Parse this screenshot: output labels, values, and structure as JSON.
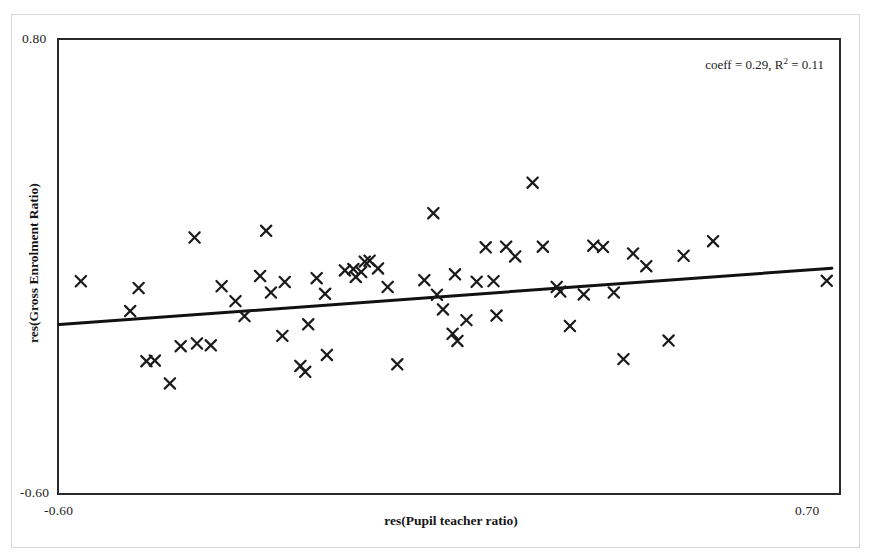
{
  "chart_data": {
    "type": "scatter",
    "title": "",
    "xlabel": "res(Pupil teacher ratio)",
    "ylabel": "res(Gross Enrolment Ratio)",
    "xlim": [
      -0.6,
      0.7
    ],
    "ylim": [
      -0.6,
      0.8
    ],
    "xticks": [
      "-0.60",
      "0.70"
    ],
    "yticks": [
      "-0.60",
      "0.80"
    ],
    "grid": false,
    "legend": null,
    "marker": "x",
    "marker_color": "#1a1a1a",
    "annotations": [
      {
        "text_prefix": "coeff  = 0.29, R",
        "superscript": "2",
        "text_suffix": " = 0.11",
        "coeff": 0.29,
        "r_squared": 0.11,
        "position": "top-right"
      }
    ],
    "fit_line": {
      "type": "linear",
      "color": "#111111",
      "slope": 0.135,
      "x_start": -0.5975,
      "y_start": -0.0787,
      "x_end": 0.6865,
      "y_end": 0.0947
    },
    "points": [
      {
        "x": -0.562,
        "y": 0.0547
      },
      {
        "x": -0.48,
        "y": -0.0372
      },
      {
        "x": -0.466,
        "y": 0.0338
      },
      {
        "x": -0.453,
        "y": -0.1913
      },
      {
        "x": -0.439,
        "y": -0.1895
      },
      {
        "x": -0.414,
        "y": -0.2597
      },
      {
        "x": -0.396,
        "y": -0.1452
      },
      {
        "x": -0.373,
        "y": 0.1893
      },
      {
        "x": -0.369,
        "y": -0.1369
      },
      {
        "x": -0.346,
        "y": -0.1426
      },
      {
        "x": -0.328,
        "y": 0.0393
      },
      {
        "x": -0.305,
        "y": -0.0066
      },
      {
        "x": -0.29,
        "y": -0.0525
      },
      {
        "x": -0.264,
        "y": 0.0707
      },
      {
        "x": -0.254,
        "y": 0.2098
      },
      {
        "x": -0.246,
        "y": 0.02
      },
      {
        "x": -0.227,
        "y": -0.1135
      },
      {
        "x": -0.223,
        "y": 0.0523
      },
      {
        "x": -0.197,
        "y": -0.206
      },
      {
        "x": -0.189,
        "y": -0.224
      },
      {
        "x": -0.184,
        "y": -0.078
      },
      {
        "x": -0.17,
        "y": 0.064
      },
      {
        "x": -0.156,
        "y": 0.016
      },
      {
        "x": -0.153,
        "y": -0.172
      },
      {
        "x": -0.123,
        "y": 0.088
      },
      {
        "x": -0.109,
        "y": 0.092
      },
      {
        "x": -0.105,
        "y": 0.068
      },
      {
        "x": -0.096,
        "y": 0.083
      },
      {
        "x": -0.09,
        "y": 0.115
      },
      {
        "x": -0.082,
        "y": 0.118
      },
      {
        "x": -0.068,
        "y": 0.094
      },
      {
        "x": -0.052,
        "y": 0.037
      },
      {
        "x": -0.036,
        "y": -0.201
      },
      {
        "x": 0.009,
        "y": 0.058
      },
      {
        "x": 0.024,
        "y": 0.264
      },
      {
        "x": 0.03,
        "y": 0.013
      },
      {
        "x": 0.04,
        "y": -0.032
      },
      {
        "x": 0.056,
        "y": -0.107
      },
      {
        "x": 0.06,
        "y": 0.076
      },
      {
        "x": 0.064,
        "y": -0.129
      },
      {
        "x": 0.079,
        "y": -0.065
      },
      {
        "x": 0.096,
        "y": 0.053
      },
      {
        "x": 0.111,
        "y": 0.159
      },
      {
        "x": 0.124,
        "y": 0.055
      },
      {
        "x": 0.129,
        "y": -0.051
      },
      {
        "x": 0.145,
        "y": 0.161
      },
      {
        "x": 0.16,
        "y": 0.131
      },
      {
        "x": 0.189,
        "y": 0.358
      },
      {
        "x": 0.206,
        "y": 0.161
      },
      {
        "x": 0.229,
        "y": 0.037
      },
      {
        "x": 0.235,
        "y": 0.023
      },
      {
        "x": 0.251,
        "y": -0.083
      },
      {
        "x": 0.274,
        "y": 0.014
      },
      {
        "x": 0.29,
        "y": 0.164
      },
      {
        "x": 0.306,
        "y": 0.16
      },
      {
        "x": 0.324,
        "y": 0.02
      },
      {
        "x": 0.34,
        "y": -0.185
      },
      {
        "x": 0.356,
        "y": 0.14
      },
      {
        "x": 0.378,
        "y": 0.101
      },
      {
        "x": 0.415,
        "y": -0.128
      },
      {
        "x": 0.44,
        "y": 0.133
      },
      {
        "x": 0.489,
        "y": 0.178
      },
      {
        "x": 0.678,
        "y": 0.056
      }
    ]
  },
  "chart": {
    "plot_area": {
      "left": 58,
      "top": 39,
      "right": 840,
      "bottom": 494
    },
    "frame_color": "#2a2a2a"
  }
}
